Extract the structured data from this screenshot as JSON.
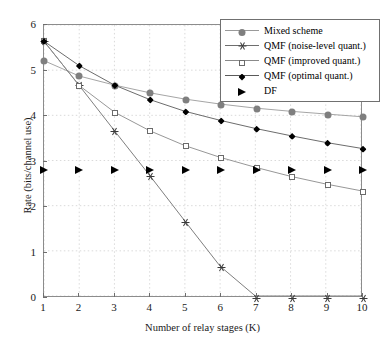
{
  "chart_data": {
    "type": "line",
    "title": "",
    "xlabel": "Number of relay stages (K)",
    "ylabel": "Rate (bits/channel use)",
    "x": [
      1,
      2,
      3,
      4,
      5,
      6,
      7,
      8,
      9,
      10
    ],
    "xticklabels": [
      "1",
      "2",
      "3",
      "4",
      "5",
      "6",
      "7",
      "8",
      "9",
      "10"
    ],
    "yticklabels": [
      "0",
      "1",
      "2",
      "3",
      "4",
      "5",
      "6"
    ],
    "yticks": [
      0,
      1,
      2,
      3,
      4,
      5,
      6
    ],
    "xlim": [
      1,
      10
    ],
    "ylim": [
      0,
      6
    ],
    "grid": true,
    "legend_position": "upper right",
    "series": [
      {
        "name": "Mixed scheme",
        "marker": "circle",
        "color": "#7f7f7f",
        "line_color": "#9a9a9a",
        "values": [
          5.21,
          4.87,
          4.67,
          4.5,
          4.36,
          4.25,
          4.16,
          4.09,
          4.03,
          3.97
        ]
      },
      {
        "name": "QMF (noise-level quant.)",
        "marker": "star",
        "color": "#3a3a3a",
        "line_color": "#6e6e6e",
        "values": [
          5.64,
          4.66,
          3.66,
          2.67,
          1.66,
          0.66,
          0.0,
          0.0,
          0.0,
          0.0
        ]
      },
      {
        "name": "QMF (improved quant.)",
        "marker": "square",
        "color": "#6b6b6b",
        "line_color": "#8a8a8a",
        "values": [
          5.64,
          4.66,
          4.07,
          3.66,
          3.33,
          3.07,
          2.85,
          2.65,
          2.48,
          2.33
        ]
      },
      {
        "name": "QMF (optimal quant.)",
        "marker": "diamond",
        "color": "#000000",
        "line_color": "#5a5a5a",
        "values": [
          5.64,
          5.1,
          4.67,
          4.35,
          4.09,
          3.89,
          3.71,
          3.55,
          3.4,
          3.27
        ]
      },
      {
        "name": "DF",
        "marker": "triangle",
        "color": "#000000",
        "line_color": "none",
        "values": [
          2.81,
          2.81,
          2.81,
          2.81,
          2.81,
          2.81,
          2.81,
          2.81,
          2.81,
          2.81
        ]
      }
    ]
  },
  "axes": {
    "x_title": "Number of relay stages (K)",
    "y_title": "Rate (bits/channel use)"
  },
  "legend": {
    "entries": [
      {
        "label": "Mixed scheme",
        "marker": "circle-icon"
      },
      {
        "label": "QMF (noise-level quant.)",
        "marker": "star-icon"
      },
      {
        "label": "QMF (improved quant.)",
        "marker": "square-icon"
      },
      {
        "label": "QMF (optimal quant.)",
        "marker": "diamond-icon"
      },
      {
        "label": "DF",
        "marker": "triangle-icon"
      }
    ]
  }
}
